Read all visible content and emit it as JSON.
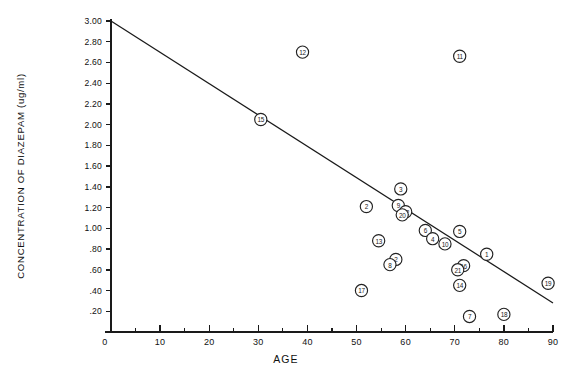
{
  "chart_data": {
    "type": "scatter",
    "title": "",
    "xlabel": "AGE",
    "ylabel": "CONCENTRATION OF DIAZEPAM (ug/ml)",
    "xlim": [
      0,
      90
    ],
    "ylim": [
      0,
      3.0
    ],
    "grid": false,
    "legend": "none",
    "x_ticks": [
      0,
      10,
      20,
      30,
      40,
      50,
      60,
      70,
      80,
      90
    ],
    "x_tick_labels": [
      "0",
      "10",
      "20",
      "30",
      "40",
      "50",
      "60",
      "70",
      "80",
      "90"
    ],
    "x_minor_tick_step": 5,
    "y_ticks": [
      0.2,
      0.4,
      0.6,
      0.8,
      1.0,
      1.2,
      1.4,
      1.6,
      1.8,
      2.0,
      2.2,
      2.4,
      2.6,
      2.8,
      3.0
    ],
    "y_tick_labels": [
      ".20",
      ".40",
      ".60",
      ".80",
      "1.00",
      "1.20",
      "1.40",
      "1.60",
      "1.80",
      "2.00",
      "2.20",
      "2.40",
      "2.60",
      "2.80",
      "3.00"
    ],
    "marker": "numbered-circle",
    "point_label_format": "subject-number",
    "series": [
      {
        "name": "patients",
        "points": [
          {
            "label": "12",
            "x": 39.0,
            "y": 2.7
          },
          {
            "label": "11",
            "x": 71.0,
            "y": 2.66
          },
          {
            "label": "15",
            "x": 30.5,
            "y": 2.05
          },
          {
            "label": "3",
            "x": 59.0,
            "y": 1.38
          },
          {
            "label": "9",
            "x": 58.5,
            "y": 1.22
          },
          {
            "label": "2",
            "x": 52.0,
            "y": 1.21
          },
          {
            "label": "22",
            "x": 60.0,
            "y": 1.16
          },
          {
            "label": "20",
            "x": 59.3,
            "y": 1.13
          },
          {
            "label": "6",
            "x": 64.0,
            "y": 0.98
          },
          {
            "label": "5",
            "x": 71.0,
            "y": 0.97
          },
          {
            "label": "4",
            "x": 65.5,
            "y": 0.9
          },
          {
            "label": "13",
            "x": 54.5,
            "y": 0.88
          },
          {
            "label": "10",
            "x": 68.0,
            "y": 0.85
          },
          {
            "label": "1",
            "x": 76.5,
            "y": 0.75
          },
          {
            "label": "2",
            "x": 58.0,
            "y": 0.7
          },
          {
            "label": "8",
            "x": 56.8,
            "y": 0.65
          },
          {
            "label": "16",
            "x": 71.8,
            "y": 0.64
          },
          {
            "label": "21",
            "x": 70.6,
            "y": 0.6
          },
          {
            "label": "19",
            "x": 89.0,
            "y": 0.47
          },
          {
            "label": "14",
            "x": 71.0,
            "y": 0.45
          },
          {
            "label": "17",
            "x": 51.0,
            "y": 0.4
          },
          {
            "label": "18",
            "x": 80.0,
            "y": 0.17
          },
          {
            "label": "7",
            "x": 73.0,
            "y": 0.15
          }
        ]
      }
    ],
    "fit_line": {
      "name": "regression-line",
      "x_start": 0.0,
      "y_start": 3.0,
      "x_end": 90.0,
      "y_end": 0.28
    }
  }
}
